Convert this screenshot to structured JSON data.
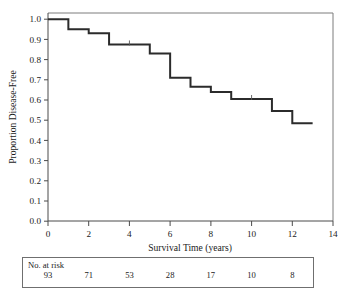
{
  "chart_data": {
    "type": "line",
    "subtype": "kaplan-meier-step",
    "title": "",
    "xlabel": "Survival Time (years)",
    "ylabel": "Proportion Disease-Free",
    "xlim": [
      0,
      14
    ],
    "ylim": [
      0.0,
      1.0
    ],
    "grid": false,
    "legend": "none",
    "xticks": [
      0,
      2,
      4,
      6,
      8,
      10,
      12,
      14
    ],
    "xtick_labels": [
      "0",
      "2",
      "4",
      "6",
      "8",
      "10",
      "12",
      "14"
    ],
    "yticks": [
      0.0,
      0.1,
      0.2,
      0.3,
      0.4,
      0.5,
      0.6,
      0.7,
      0.8,
      0.9,
      1.0
    ],
    "ytick_labels": [
      "0.0",
      "0.1",
      "0.2",
      "0.3",
      "0.4",
      "0.5",
      "0.6",
      "0.7",
      "0.8",
      "0.9",
      "1.0"
    ],
    "series": [
      {
        "name": "Disease-Free Survival",
        "color": "#2b2b2b",
        "x": [
          0,
          1,
          1,
          2,
          2,
          3,
          3,
          5,
          5,
          6,
          6,
          7,
          7,
          8,
          8,
          9,
          9,
          11,
          11,
          12,
          12,
          13
        ],
        "y": [
          1.0,
          1.0,
          0.95,
          0.95,
          0.93,
          0.93,
          0.875,
          0.875,
          0.83,
          0.83,
          0.71,
          0.71,
          0.665,
          0.665,
          0.64,
          0.64,
          0.605,
          0.605,
          0.545,
          0.545,
          0.485,
          0.485
        ],
        "steps": [
          {
            "time": 0,
            "proportion": 1.0
          },
          {
            "time": 1,
            "proportion": 0.95
          },
          {
            "time": 2,
            "proportion": 0.93
          },
          {
            "time": 3,
            "proportion": 0.875
          },
          {
            "time": 5,
            "proportion": 0.83
          },
          {
            "time": 6,
            "proportion": 0.71
          },
          {
            "time": 7,
            "proportion": 0.665
          },
          {
            "time": 8,
            "proportion": 0.64
          },
          {
            "time": 9,
            "proportion": 0.605
          },
          {
            "time": 11,
            "proportion": 0.545
          },
          {
            "time": 12,
            "proportion": 0.485
          },
          {
            "time": 13,
            "proportion": 0.485
          }
        ],
        "censored": [
          {
            "time": 4.0,
            "proportion": 0.875
          },
          {
            "time": 10.0,
            "proportion": 0.605
          }
        ]
      }
    ]
  },
  "risk_table": {
    "label": "No. at risk",
    "times": [
      0,
      2,
      4,
      6,
      8,
      10,
      12
    ],
    "counts": [
      "93",
      "71",
      "53",
      "28",
      "17",
      "10",
      "8"
    ]
  },
  "axes": {
    "x_title": "Survival Time (years)",
    "y_title": "Proportion Disease-Free"
  }
}
